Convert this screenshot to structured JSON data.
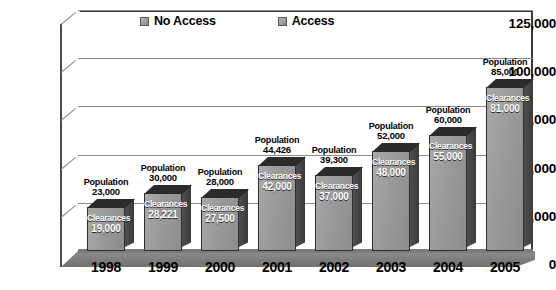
{
  "chart_data": {
    "type": "bar",
    "title": "",
    "xlabel": "",
    "ylabel": "",
    "ylim": [
      0,
      125000
    ],
    "grid": true,
    "legend_position": "top",
    "categories": [
      "1998",
      "1999",
      "2000",
      "2001",
      "2002",
      "2003",
      "2004",
      "2005"
    ],
    "ytick_labels": [
      "0",
      "25,000",
      "50,000",
      "75,000",
      "100,000",
      "125,000"
    ],
    "ytick_values": [
      0,
      25000,
      50000,
      75000,
      100000,
      125000
    ],
    "legend": [
      {
        "label": "No Access",
        "color": "#9a9a9a"
      },
      {
        "label": "Access",
        "color": "#8a8a8a"
      }
    ],
    "series": [
      {
        "name": "Population",
        "label_prefix": "Population",
        "values": [
          23000,
          30000,
          28000,
          44426,
          39300,
          52000,
          60000,
          85000
        ],
        "value_labels": [
          "23,000",
          "30,000",
          "28,000",
          "44,426",
          "39,300",
          "52,000",
          "60,000",
          "85,000"
        ]
      },
      {
        "name": "Clearances",
        "label_prefix": "Clearances",
        "values": [
          19000,
          28221,
          27500,
          42000,
          37000,
          48000,
          55000,
          81000
        ],
        "value_labels": [
          "19,000",
          "28,221",
          "27,500",
          "42,000",
          "37,000",
          "48,000",
          "55,000",
          "81,000"
        ]
      }
    ]
  },
  "labels": {
    "population_prefix": "Population",
    "clearances_prefix": "Clearances"
  }
}
